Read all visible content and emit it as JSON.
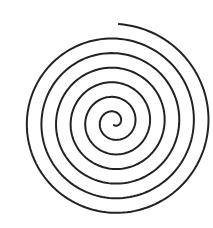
{
  "image": {
    "width": 213,
    "height": 228,
    "background": "#ffffff",
    "subject": "spiral-drawing"
  },
  "spiral": {
    "center_x": 114,
    "center_y": 122,
    "turns": 6.5,
    "start_radius": 3,
    "end_radius": 98,
    "stroke_color": "#222222",
    "stroke_width": 2
  }
}
